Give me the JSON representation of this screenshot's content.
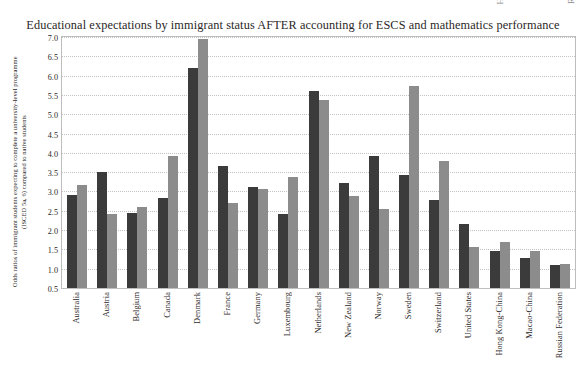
{
  "bleed_marks": [
    {
      "text": "H",
      "x": 495
    },
    {
      "text": "R",
      "x": 566
    }
  ],
  "chart_data": {
    "type": "bar",
    "title": "Educational expectations by immigrant status AFTER accounting for ESCS and mathematics performance",
    "xlabel": "",
    "ylabel": "Odds ratios of immigrant students expecting to complete a university-level programme (ISCED 5a, 6) compared to native students",
    "ylim": [
      0.5,
      7.0
    ],
    "ytick_labels": [
      "7.0",
      "6.5",
      "6.0",
      "5.5",
      "5.0",
      "4.5",
      "4.0",
      "3.5",
      "3.0",
      "2.5",
      "2.0",
      "1.5",
      "1.0",
      "0.5"
    ],
    "ytick_values": [
      7.0,
      6.5,
      6.0,
      5.5,
      5.0,
      4.5,
      4.0,
      3.5,
      3.0,
      2.5,
      2.0,
      1.5,
      1.0,
      0.5
    ],
    "grid": true,
    "legend_position": "none",
    "categories": [
      "Australia",
      "Austria",
      "Belgium",
      "Canada",
      "Denmark",
      "France",
      "Germany",
      "Luxembourg",
      "Netherlands",
      "New Zealand",
      "Norway",
      "Sweden",
      "Switzerland",
      "United States",
      "Hong Kong-China",
      "Macao-China",
      "Russian Federation"
    ],
    "series": [
      {
        "name": "First-generation immigrant students",
        "color": "#3c3b3b",
        "values": [
          2.92,
          3.51,
          2.44,
          2.83,
          6.19,
          3.66,
          3.12,
          2.41,
          5.6,
          3.22,
          3.92,
          3.42,
          2.78,
          2.15,
          1.45,
          1.27,
          1.1
        ]
      },
      {
        "name": "Second-generation immigrant students",
        "color": "#8c8c8c",
        "values": [
          3.18,
          2.41,
          2.6,
          3.93,
          6.94,
          2.7,
          3.06,
          3.38,
          5.38,
          2.88,
          2.54,
          5.72,
          3.8,
          1.55,
          1.68,
          1.45,
          1.12
        ]
      }
    ]
  }
}
